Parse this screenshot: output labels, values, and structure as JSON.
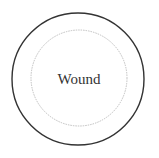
{
  "diagram": {
    "label": "Wound",
    "outer_circle": {
      "cx": 78,
      "cy": 79,
      "r": 66,
      "stroke": "#333333",
      "stroke_width": 1.4
    },
    "inner_circle": {
      "cx": 79,
      "cy": 78,
      "r": 48,
      "stroke": "#b8b8b8",
      "stroke_width": 0.9,
      "style": "dotted"
    }
  }
}
